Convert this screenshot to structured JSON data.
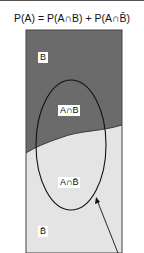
{
  "formula": {
    "text": "P(A) = P(A∩B) + P(A∩B̄)"
  },
  "diagram": {
    "region_b_color": "#6b6b6b",
    "region_not_b_color": "#e4e4e4",
    "border_color": "#444444",
    "labels": {
      "b": "B",
      "a_and_b": "A∩B",
      "a_and_not_b": "A∩B̄",
      "not_b": "B̄"
    }
  }
}
